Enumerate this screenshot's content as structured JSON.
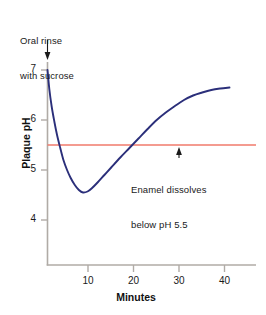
{
  "chart_data": {
    "type": "line",
    "title": "",
    "xlabel": "Minutes",
    "ylabel": "Plaque pH",
    "xlim": [
      0,
      45
    ],
    "ylim": [
      3.1,
      7.45
    ],
    "grid": false,
    "legend": "none",
    "x_ticks": [
      10,
      20,
      30,
      40
    ],
    "y_ticks": [
      4,
      5,
      6,
      7
    ],
    "x_tick_labels": [
      "10",
      "20",
      "30",
      "40"
    ],
    "y_tick_labels": [
      "4",
      "5",
      "6",
      "7"
    ],
    "series": [
      {
        "name": "Plaque pH after sucrose rinse",
        "color": "#2b2f7a",
        "points": [
          [
            0.0,
            7.0
          ],
          [
            0.4,
            6.62
          ],
          [
            0.9,
            6.28
          ],
          [
            1.5,
            5.97
          ],
          [
            2.1,
            5.7
          ],
          [
            2.8,
            5.44
          ],
          [
            3.5,
            5.2
          ],
          [
            4.3,
            5.0
          ],
          [
            5.1,
            4.84
          ],
          [
            6.0,
            4.7
          ],
          [
            6.9,
            4.6
          ],
          [
            7.8,
            4.55
          ],
          [
            8.8,
            4.57
          ],
          [
            9.8,
            4.64
          ],
          [
            11.0,
            4.75
          ],
          [
            12.5,
            4.9
          ],
          [
            14.0,
            5.05
          ],
          [
            16.0,
            5.25
          ],
          [
            18.0,
            5.44
          ],
          [
            20.0,
            5.63
          ],
          [
            22.0,
            5.82
          ],
          [
            24.0,
            6.0
          ],
          [
            26.0,
            6.15
          ],
          [
            28.0,
            6.28
          ],
          [
            30.0,
            6.4
          ],
          [
            32.0,
            6.49
          ],
          [
            34.0,
            6.55
          ],
          [
            36.0,
            6.6
          ],
          [
            38.0,
            6.63
          ],
          [
            40.0,
            6.65
          ]
        ]
      }
    ],
    "threshold_line": {
      "name": "Enamel dissolution threshold",
      "value": 5.5,
      "color": "#f07a6b",
      "orientation": "horizontal"
    },
    "annotations": [
      {
        "id": "oral-rinse",
        "text": "Oral rinse\nwith sucrose",
        "line1": "Oral rinse",
        "line2": "with sucrose",
        "arrow": "down",
        "points_to_x": 0,
        "points_to_y": 7.45
      },
      {
        "id": "enamel-dissolves",
        "text": "Enamel dissolves\nbelow pH 5.5",
        "line1": "Enamel dissolves",
        "line2": "below pH 5.5",
        "arrow": "up",
        "points_to_x": 30,
        "points_to_y": 5.5
      }
    ]
  },
  "axes": {
    "y_label": "Plaque pH",
    "x_label": "Minutes",
    "axis_color": "#b0aba6",
    "tick_color": "#b0aba6"
  },
  "ticks": {
    "y": [
      {
        "label": "7"
      },
      {
        "label": "6"
      },
      {
        "label": "5"
      },
      {
        "label": "4"
      }
    ],
    "x": [
      {
        "label": "10"
      },
      {
        "label": "20"
      },
      {
        "label": "30"
      },
      {
        "label": "40"
      }
    ]
  },
  "annotations": {
    "rinse": {
      "line1": "Oral rinse",
      "line2": "with sucrose"
    },
    "enamel": {
      "line1": "Enamel dissolves",
      "line2": "below pH 5.5"
    }
  },
  "colors": {
    "curve": "#2b2f7a",
    "threshold": "#f07a6b",
    "axis": "#b0aba6",
    "text": "#1a1a1a",
    "background": "#ffffff"
  }
}
